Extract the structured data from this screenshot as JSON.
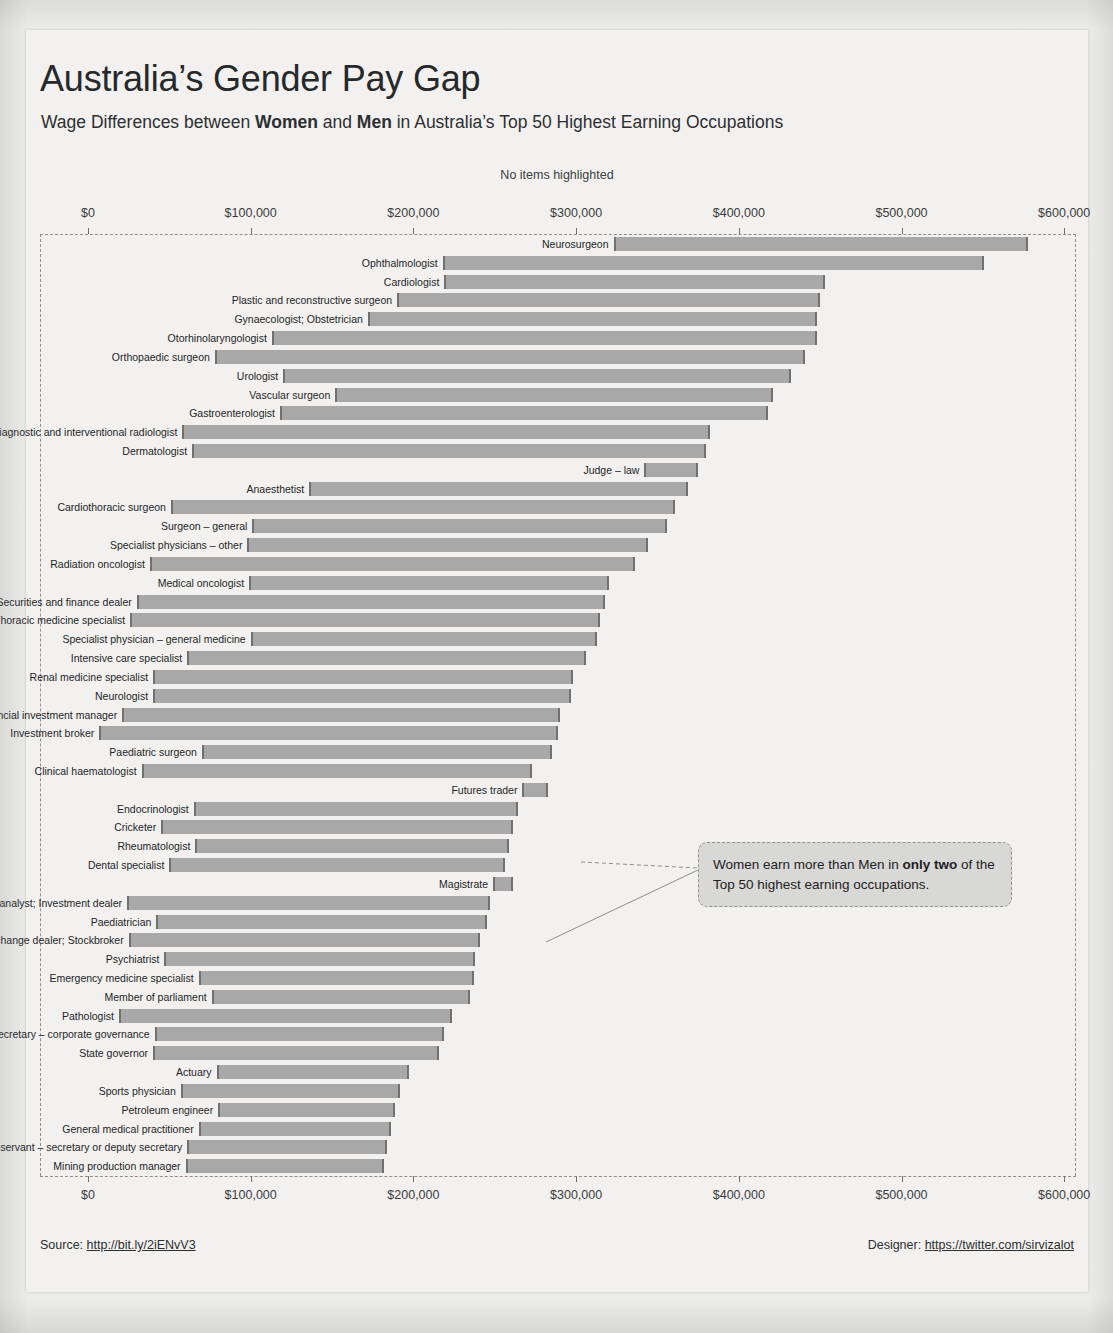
{
  "header": {
    "title": "Australia’s Gender Pay Gap",
    "subtitle_pre": "Wage Differences between ",
    "subtitle_bold1": "Women",
    "subtitle_mid": " and ",
    "subtitle_bold2": "Men",
    "subtitle_post": " in Australia’s Top 50 Highest Earning Occupations",
    "highlight_status": "No items highlighted"
  },
  "annotation": {
    "text_pre": "Women earn more than Men in ",
    "text_bold": "only two",
    "text_post": " of the Top 50 highest earning occupations."
  },
  "footer": {
    "source_label": "Source: ",
    "source_link": "http://bit.ly/2iENvV3",
    "designer_label": "Designer: ",
    "designer_link": "https://twitter.com/sirvizalot"
  },
  "chart_data": {
    "type": "bar",
    "title": "Australia’s Gender Pay Gap",
    "subtitle": "Wage Differences between Women and Men in Australia’s Top 50 Highest Earning Occupations",
    "xlabel": "",
    "ylabel": "",
    "xlim": [
      0,
      620000
    ],
    "grid": false,
    "legend": "none",
    "axis_ticks": [
      {
        "value": 0,
        "label": "$0"
      },
      {
        "value": 100000,
        "label": "$100,000"
      },
      {
        "value": 200000,
        "label": "$200,000"
      },
      {
        "value": 300000,
        "label": "$300,000"
      },
      {
        "value": 400000,
        "label": "$400,000"
      },
      {
        "value": 500000,
        "label": "$500,000"
      },
      {
        "value": 600000,
        "label": "$600,000"
      }
    ],
    "series": [
      {
        "name": "Women"
      },
      {
        "name": "Men"
      }
    ],
    "categories": [
      "Neurosurgeon",
      "Ophthalmologist",
      "Cardiologist",
      "Plastic and reconstructive surgeon",
      "Gynaecologist; Obstetrician",
      "Otorhinolaryngologist",
      "Orthopaedic surgeon",
      "Urologist",
      "Vascular surgeon",
      "Gastroenterologist",
      "Diagnostic and interventional radiologist",
      "Dermatologist",
      "Judge – law",
      "Anaesthetist",
      "Cardiothoracic surgeon",
      "Surgeon – general",
      "Specialist physicians – other",
      "Radiation oncologist",
      "Medical oncologist",
      "Securities and finance dealer",
      "Thoracic medicine specialist",
      "Specialist physician – general medicine",
      "Intensive care specialist",
      "Renal medicine specialist",
      "Neurologist",
      "Financial investment manager",
      "Investment broker",
      "Paediatric surgeon",
      "Clinical haematologist",
      "Futures trader",
      "Endocrinologist",
      "Cricketer",
      "Rheumatologist",
      "Dental specialist",
      "Magistrate",
      "Equities analyst; Investment dealer",
      "Paediatrician",
      "Stock exchange dealer; Stockbroker",
      "Psychiatrist",
      "Emergency medicine specialist",
      "Member of parliament",
      "Pathologist",
      "Company secretary – corporate governance",
      "State governor",
      "Actuary",
      "Sports physician",
      "Petroleum engineer",
      "General medical practitioner",
      "Public servant – secretary or deputy secretary",
      "Mining production manager"
    ],
    "bars": [
      {
        "occupation": "Neurosurgeon",
        "women": 323000,
        "men": 578000
      },
      {
        "occupation": "Ophthalmologist",
        "women": 218000,
        "men": 551000
      },
      {
        "occupation": "Cardiologist",
        "women": 219000,
        "men": 453000
      },
      {
        "occupation": "Plastic and reconstructive surgeon",
        "women": 190000,
        "men": 450000
      },
      {
        "occupation": "Gynaecologist; Obstetrician",
        "women": 172000,
        "men": 448000
      },
      {
        "occupation": "Otorhinolaryngologist",
        "women": 113000,
        "men": 448000
      },
      {
        "occupation": "Orthopaedic surgeon",
        "women": 78000,
        "men": 441000
      },
      {
        "occupation": "Urologist",
        "women": 120000,
        "men": 432000
      },
      {
        "occupation": "Vascular surgeon",
        "women": 152000,
        "men": 421000
      },
      {
        "occupation": "Gastroenterologist",
        "women": 118000,
        "men": 418000
      },
      {
        "occupation": "Diagnostic and interventional radiologist",
        "women": 58000,
        "men": 382000
      },
      {
        "occupation": "Dermatologist",
        "women": 64000,
        "men": 380000
      },
      {
        "occupation": "Judge – law",
        "women": 342000,
        "men": 375000
      },
      {
        "occupation": "Anaesthetist",
        "women": 136000,
        "men": 369000
      },
      {
        "occupation": "Cardiothoracic surgeon",
        "women": 51000,
        "men": 361000
      },
      {
        "occupation": "Surgeon – general",
        "women": 101000,
        "men": 356000
      },
      {
        "occupation": "Specialist physicians – other",
        "women": 98000,
        "men": 344000
      },
      {
        "occupation": "Radiation oncologist",
        "women": 38000,
        "men": 336000
      },
      {
        "occupation": "Medical oncologist",
        "women": 99000,
        "men": 320000
      },
      {
        "occupation": "Securities and finance dealer",
        "women": 30000,
        "men": 318000
      },
      {
        "occupation": "Thoracic medicine specialist",
        "women": 26000,
        "men": 315000
      },
      {
        "occupation": "Specialist physician – general medicine",
        "women": 100000,
        "men": 313000
      },
      {
        "occupation": "Intensive care specialist",
        "women": 61000,
        "men": 306000
      },
      {
        "occupation": "Renal medicine specialist",
        "women": 40000,
        "men": 298000
      },
      {
        "occupation": "Neurologist",
        "women": 40000,
        "men": 297000
      },
      {
        "occupation": "Financial investment manager",
        "women": 21000,
        "men": 290000
      },
      {
        "occupation": "Investment broker",
        "women": 7000,
        "men": 289000
      },
      {
        "occupation": "Paediatric surgeon",
        "women": 70000,
        "men": 285000
      },
      {
        "occupation": "Clinical haematologist",
        "women": 33000,
        "men": 273000
      },
      {
        "occupation": "Futures trader",
        "women": 283000,
        "men": 267000
      },
      {
        "occupation": "Endocrinologist",
        "women": 65000,
        "men": 264000
      },
      {
        "occupation": "Cricketer",
        "women": 45000,
        "men": 261000
      },
      {
        "occupation": "Rheumatologist",
        "women": 66000,
        "men": 259000
      },
      {
        "occupation": "Dental specialist",
        "women": 50000,
        "men": 256000
      },
      {
        "occupation": "Magistrate",
        "women": 261000,
        "men": 249000
      },
      {
        "occupation": "Equities analyst; Investment dealer",
        "women": 24000,
        "men": 247000
      },
      {
        "occupation": "Paediatrician",
        "women": 42000,
        "men": 245000
      },
      {
        "occupation": "Stock exchange dealer; Stockbroker",
        "women": 25000,
        "men": 241000
      },
      {
        "occupation": "Psychiatrist",
        "women": 47000,
        "men": 238000
      },
      {
        "occupation": "Emergency medicine specialist",
        "women": 68000,
        "men": 237000
      },
      {
        "occupation": "Member of parliament",
        "women": 76000,
        "men": 235000
      },
      {
        "occupation": "Pathologist",
        "women": 19000,
        "men": 224000
      },
      {
        "occupation": "Company secretary – corporate governance",
        "women": 41000,
        "men": 219000
      },
      {
        "occupation": "State governor",
        "women": 40000,
        "men": 216000
      },
      {
        "occupation": "Actuary",
        "women": 79000,
        "men": 197000
      },
      {
        "occupation": "Sports physician",
        "women": 57000,
        "men": 192000
      },
      {
        "occupation": "Petroleum engineer",
        "women": 80000,
        "men": 189000
      },
      {
        "occupation": "General medical practitioner",
        "women": 68000,
        "men": 186000
      },
      {
        "occupation": "Public servant – secretary or deputy secretary",
        "women": 61000,
        "men": 184000
      },
      {
        "occupation": "Mining production manager",
        "women": 60000,
        "men": 182000
      }
    ]
  }
}
